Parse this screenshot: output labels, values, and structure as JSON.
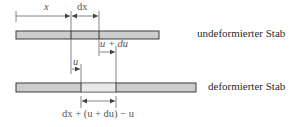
{
  "diagram": {
    "top_bar": {
      "label": "undeformierter Stab",
      "x_start": 16,
      "x_end": 159,
      "dividers": [
        71,
        99
      ],
      "fill": "#cdcdcd",
      "border": "#3a3a3a"
    },
    "bottom_bar": {
      "label": "deformierter Stab",
      "x_start": 16,
      "x_end": 196,
      "dividers": [
        81,
        116
      ],
      "fill": "#cdcdcd",
      "highlight_fill": "#e8e8e8",
      "border": "#3a3a3a"
    },
    "dimensions": {
      "x": "x",
      "dx": "dx",
      "u": "u",
      "u_plus_du": "u + du",
      "deformed_length": "dx + (u + du) − u"
    }
  }
}
